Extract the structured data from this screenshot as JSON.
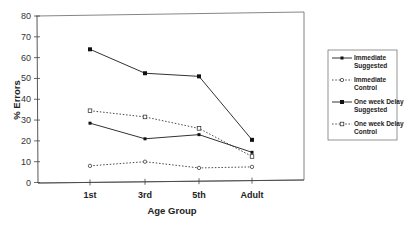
{
  "chart_data": {
    "type": "line",
    "title": "",
    "xlabel": "Age Group",
    "ylabel": "% Errors",
    "categories": [
      "1st",
      "3rd",
      "5th",
      "Adult"
    ],
    "ylim": [
      0,
      80
    ],
    "yticks": [
      0,
      10,
      20,
      30,
      40,
      50,
      60,
      70,
      80
    ],
    "grid": false,
    "legend_position": "right",
    "series": [
      {
        "name": "Immediate Suggested",
        "line": "solid",
        "marker": "filled-diamond",
        "values": [
          28.5,
          21,
          23,
          14.5
        ]
      },
      {
        "name": "Immediate Control",
        "line": "dotted",
        "marker": "open-circle",
        "values": [
          8,
          10,
          7,
          7.5
        ]
      },
      {
        "name": "One week Delay Suggested",
        "line": "solid",
        "marker": "filled-square",
        "values": [
          64,
          52.5,
          51,
          20.5
        ]
      },
      {
        "name": "One week Delay Control",
        "line": "dotted",
        "marker": "open-square",
        "values": [
          34.5,
          31.5,
          26,
          12.5
        ]
      }
    ]
  },
  "legend": {
    "items": [
      {
        "line1": "Immediate",
        "line2": "Suggested"
      },
      {
        "line1": "Immediate",
        "line2": "Control"
      },
      {
        "line1": "One week Delay",
        "line2": "Suggested"
      },
      {
        "line1": "One week Delay",
        "line2": "Control"
      }
    ]
  }
}
